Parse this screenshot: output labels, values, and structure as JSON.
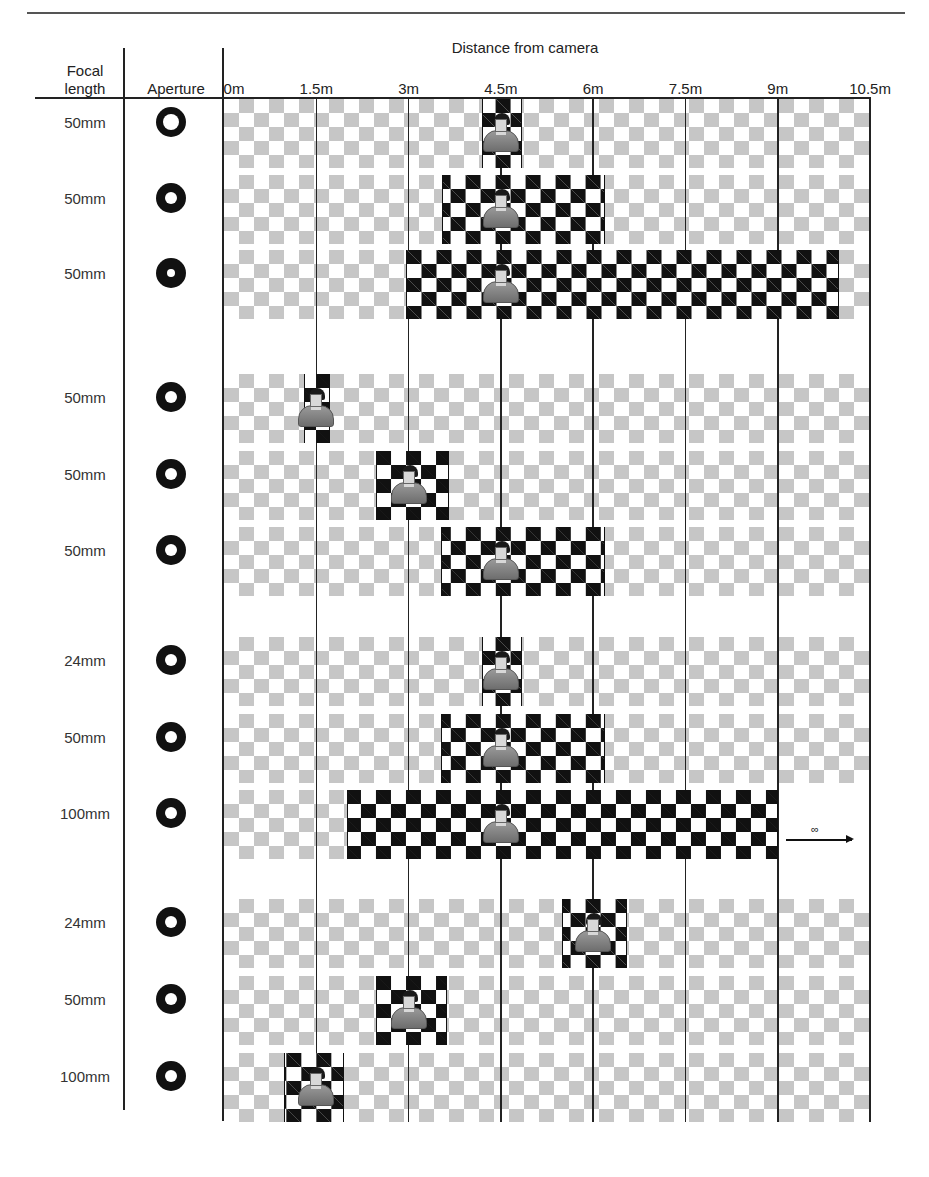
{
  "header": {
    "focal_length_label": "Focal length",
    "focal_length_line1": "Focal",
    "focal_length_line2": "length",
    "aperture_label": "Aperture",
    "distance_title": "Distance from camera"
  },
  "axis": {
    "unit": "m",
    "ticks": [
      {
        "value": 0,
        "label": "0m"
      },
      {
        "value": 1.5,
        "label": "1.5m"
      },
      {
        "value": 3,
        "label": "3m"
      },
      {
        "value": 4.5,
        "label": "4.5m"
      },
      {
        "value": 6,
        "label": "6m"
      },
      {
        "value": 7.5,
        "label": "7.5m"
      },
      {
        "value": 9,
        "label": "9m"
      },
      {
        "value": 10.5,
        "label": "10.5m"
      }
    ]
  },
  "colors": {
    "sharp_checker": "#111111",
    "blurred_checker": "#c4c4c4",
    "lines": "#222222",
    "aperture": "#111111"
  },
  "groups": [
    {
      "name": "aperture-comparison",
      "rows": [
        0,
        1,
        2
      ]
    },
    {
      "name": "focus-distance-comparison",
      "rows": [
        3,
        4,
        5
      ]
    },
    {
      "name": "focal-length-comparison-same-distance",
      "rows": [
        6,
        7,
        8
      ]
    },
    {
      "name": "focal-length-comparison-same-framing",
      "rows": [
        9,
        10,
        11
      ]
    }
  ],
  "rows": [
    {
      "focal_length": "50mm",
      "aperture": "large",
      "hole_ratio": 0.56,
      "subject_m": 4.5,
      "sharp_from_m": 4.2,
      "sharp_to_m": 4.85,
      "infinity": false
    },
    {
      "focal_length": "50mm",
      "aperture": "medium",
      "hole_ratio": 0.42,
      "subject_m": 4.5,
      "sharp_from_m": 3.55,
      "sharp_to_m": 6.2,
      "infinity": false
    },
    {
      "focal_length": "50mm",
      "aperture": "small",
      "hole_ratio": 0.26,
      "subject_m": 4.5,
      "sharp_from_m": 2.95,
      "sharp_to_m": 10.0,
      "infinity": false
    },
    {
      "focal_length": "50mm",
      "aperture": "medium",
      "hole_ratio": 0.42,
      "subject_m": 1.5,
      "sharp_from_m": 1.3,
      "sharp_to_m": 1.72,
      "infinity": false
    },
    {
      "focal_length": "50mm",
      "aperture": "medium",
      "hole_ratio": 0.42,
      "subject_m": 3.0,
      "sharp_from_m": 2.47,
      "sharp_to_m": 3.65,
      "infinity": false
    },
    {
      "focal_length": "50mm",
      "aperture": "medium",
      "hole_ratio": 0.42,
      "subject_m": 4.5,
      "sharp_from_m": 3.53,
      "sharp_to_m": 6.2,
      "infinity": false
    },
    {
      "focal_length": "24mm",
      "aperture": "medium",
      "hole_ratio": 0.42,
      "subject_m": 4.5,
      "sharp_from_m": 4.2,
      "sharp_to_m": 4.85,
      "infinity": false
    },
    {
      "focal_length": "50mm",
      "aperture": "medium",
      "hole_ratio": 0.42,
      "subject_m": 4.5,
      "sharp_from_m": 3.53,
      "sharp_to_m": 6.2,
      "infinity": false
    },
    {
      "focal_length": "100mm",
      "aperture": "medium",
      "hole_ratio": 0.42,
      "subject_m": 4.5,
      "sharp_from_m": 2.0,
      "sharp_to_m": 9.0,
      "infinity": true,
      "infinity_symbol": "∞"
    },
    {
      "focal_length": "24mm",
      "aperture": "medium",
      "hole_ratio": 0.42,
      "subject_m": 6.0,
      "sharp_from_m": 5.5,
      "sharp_to_m": 6.55,
      "infinity": false
    },
    {
      "focal_length": "50mm",
      "aperture": "medium",
      "hole_ratio": 0.42,
      "subject_m": 3.0,
      "sharp_from_m": 2.47,
      "sharp_to_m": 3.62,
      "infinity": false
    },
    {
      "focal_length": "100mm",
      "aperture": "medium",
      "hole_ratio": 0.42,
      "subject_m": 1.5,
      "sharp_from_m": 0.97,
      "sharp_to_m": 1.95,
      "infinity": false
    }
  ]
}
